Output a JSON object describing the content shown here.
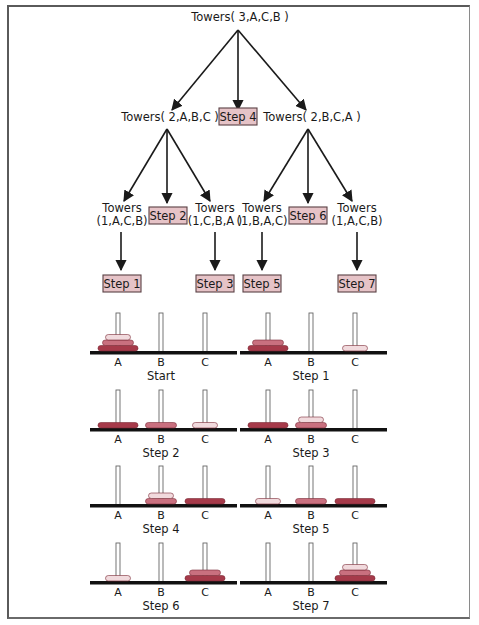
{
  "colors": {
    "step_box_fill": "#e6c3c7",
    "step_box_stroke": "#5a4044",
    "disk_small": "#f1dadd",
    "disk_medium": "#c9707f",
    "disk_large": "#a63a4a",
    "base": "#111111",
    "peg_fill": "#ffffff",
    "peg_stroke": "#666666"
  },
  "tree": {
    "root": {
      "label": "Towers( 3,A,C,B )",
      "x": 240,
      "y": 21
    },
    "level1": [
      {
        "label": "Towers( 2,A,B,C )",
        "x": 170,
        "y": 121
      },
      {
        "step": "Step 4",
        "x": 238,
        "y": 121
      },
      {
        "label": "Towers( 2,B,C,A )",
        "x": 312,
        "y": 121
      }
    ],
    "level2": [
      {
        "line1": "Towers",
        "line2": "(1,A,C,B)",
        "x": 122,
        "y": 212,
        "leaf_step": "Step 1"
      },
      {
        "step": "Step 2",
        "x": 168,
        "y": 216
      },
      {
        "line1": "Towers",
        "line2": "(1,C,B,A )",
        "x": 215,
        "y": 212,
        "leaf_step": "Step 3"
      },
      {
        "line1": "Towers",
        "line2": "(1,B,A,C)",
        "x": 262,
        "y": 212,
        "leaf_step": "Step 5"
      },
      {
        "step": "Step 6",
        "x": 308,
        "y": 216
      },
      {
        "line1": "Towers",
        "line2": "(1,A,C,B)",
        "x": 357,
        "y": 212,
        "leaf_step": "Step 7"
      }
    ]
  },
  "peg_labels": [
    "A",
    "B",
    "C"
  ],
  "states": [
    {
      "caption": "Start",
      "pegs": [
        [
          "large",
          "medium",
          "small"
        ],
        [],
        []
      ]
    },
    {
      "caption": "Step 1",
      "pegs": [
        [
          "large",
          "medium"
        ],
        [],
        [
          "small"
        ]
      ]
    },
    {
      "caption": "Step 2",
      "pegs": [
        [
          "large"
        ],
        [
          "medium"
        ],
        [
          "small"
        ]
      ]
    },
    {
      "caption": "Step 3",
      "pegs": [
        [
          "large"
        ],
        [
          "medium",
          "small"
        ],
        []
      ]
    },
    {
      "caption": "Step 4",
      "pegs": [
        [],
        [
          "medium",
          "small"
        ],
        [
          "large"
        ]
      ]
    },
    {
      "caption": "Step 5",
      "pegs": [
        [
          "small"
        ],
        [
          "medium"
        ],
        [
          "large"
        ]
      ]
    },
    {
      "caption": "Step 6",
      "pegs": [
        [
          "small"
        ],
        [],
        [
          "large",
          "medium"
        ]
      ]
    },
    {
      "caption": "Step 7",
      "pegs": [
        [],
        [],
        [
          "large",
          "medium",
          "small"
        ]
      ]
    }
  ]
}
